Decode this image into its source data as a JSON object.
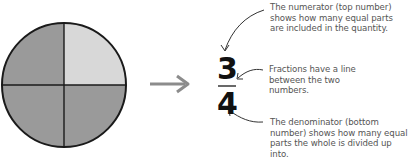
{
  "diagram": {
    "pie": {
      "total_parts": 4,
      "shaded_parts": 3,
      "colors": {
        "shaded": "#9a9a9a",
        "unshaded": "#d8d8d8",
        "outline": "#1a1a1a"
      }
    },
    "arrow_color": "#8c8c8c",
    "fraction": {
      "numerator": "3",
      "denominator": "4"
    },
    "annotations": {
      "numerator": "The numerator (top number) shows how many equal parts are included in the quantity.",
      "line": "Fractions have a line between the two numbers.",
      "denominator": "The denominator (bottom number) shows how many equal parts the whole is divided up into."
    }
  }
}
